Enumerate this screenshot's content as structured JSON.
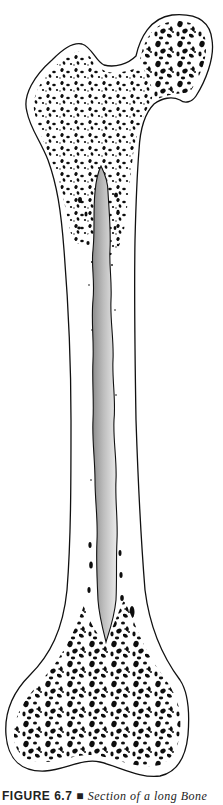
{
  "figure": {
    "parts": {
      "proximal_epiphysis": "spongy bone (head, neck, greater trochanter)",
      "diaphysis": "compact bone shaft",
      "medullary_cavity": "central hollow cavity",
      "distal_epiphysis": "spongy bone (condyles)"
    },
    "colors": {
      "outline": "#111111",
      "trabeculae": "#0d0d0d",
      "bone_fill": "#ffffff",
      "cavity_dark": "#8c8c8c",
      "cavity_light": "#ececec"
    }
  },
  "caption": {
    "label": "FIGURE 6.7",
    "separator": "■",
    "text": "Section of a long Bone"
  }
}
